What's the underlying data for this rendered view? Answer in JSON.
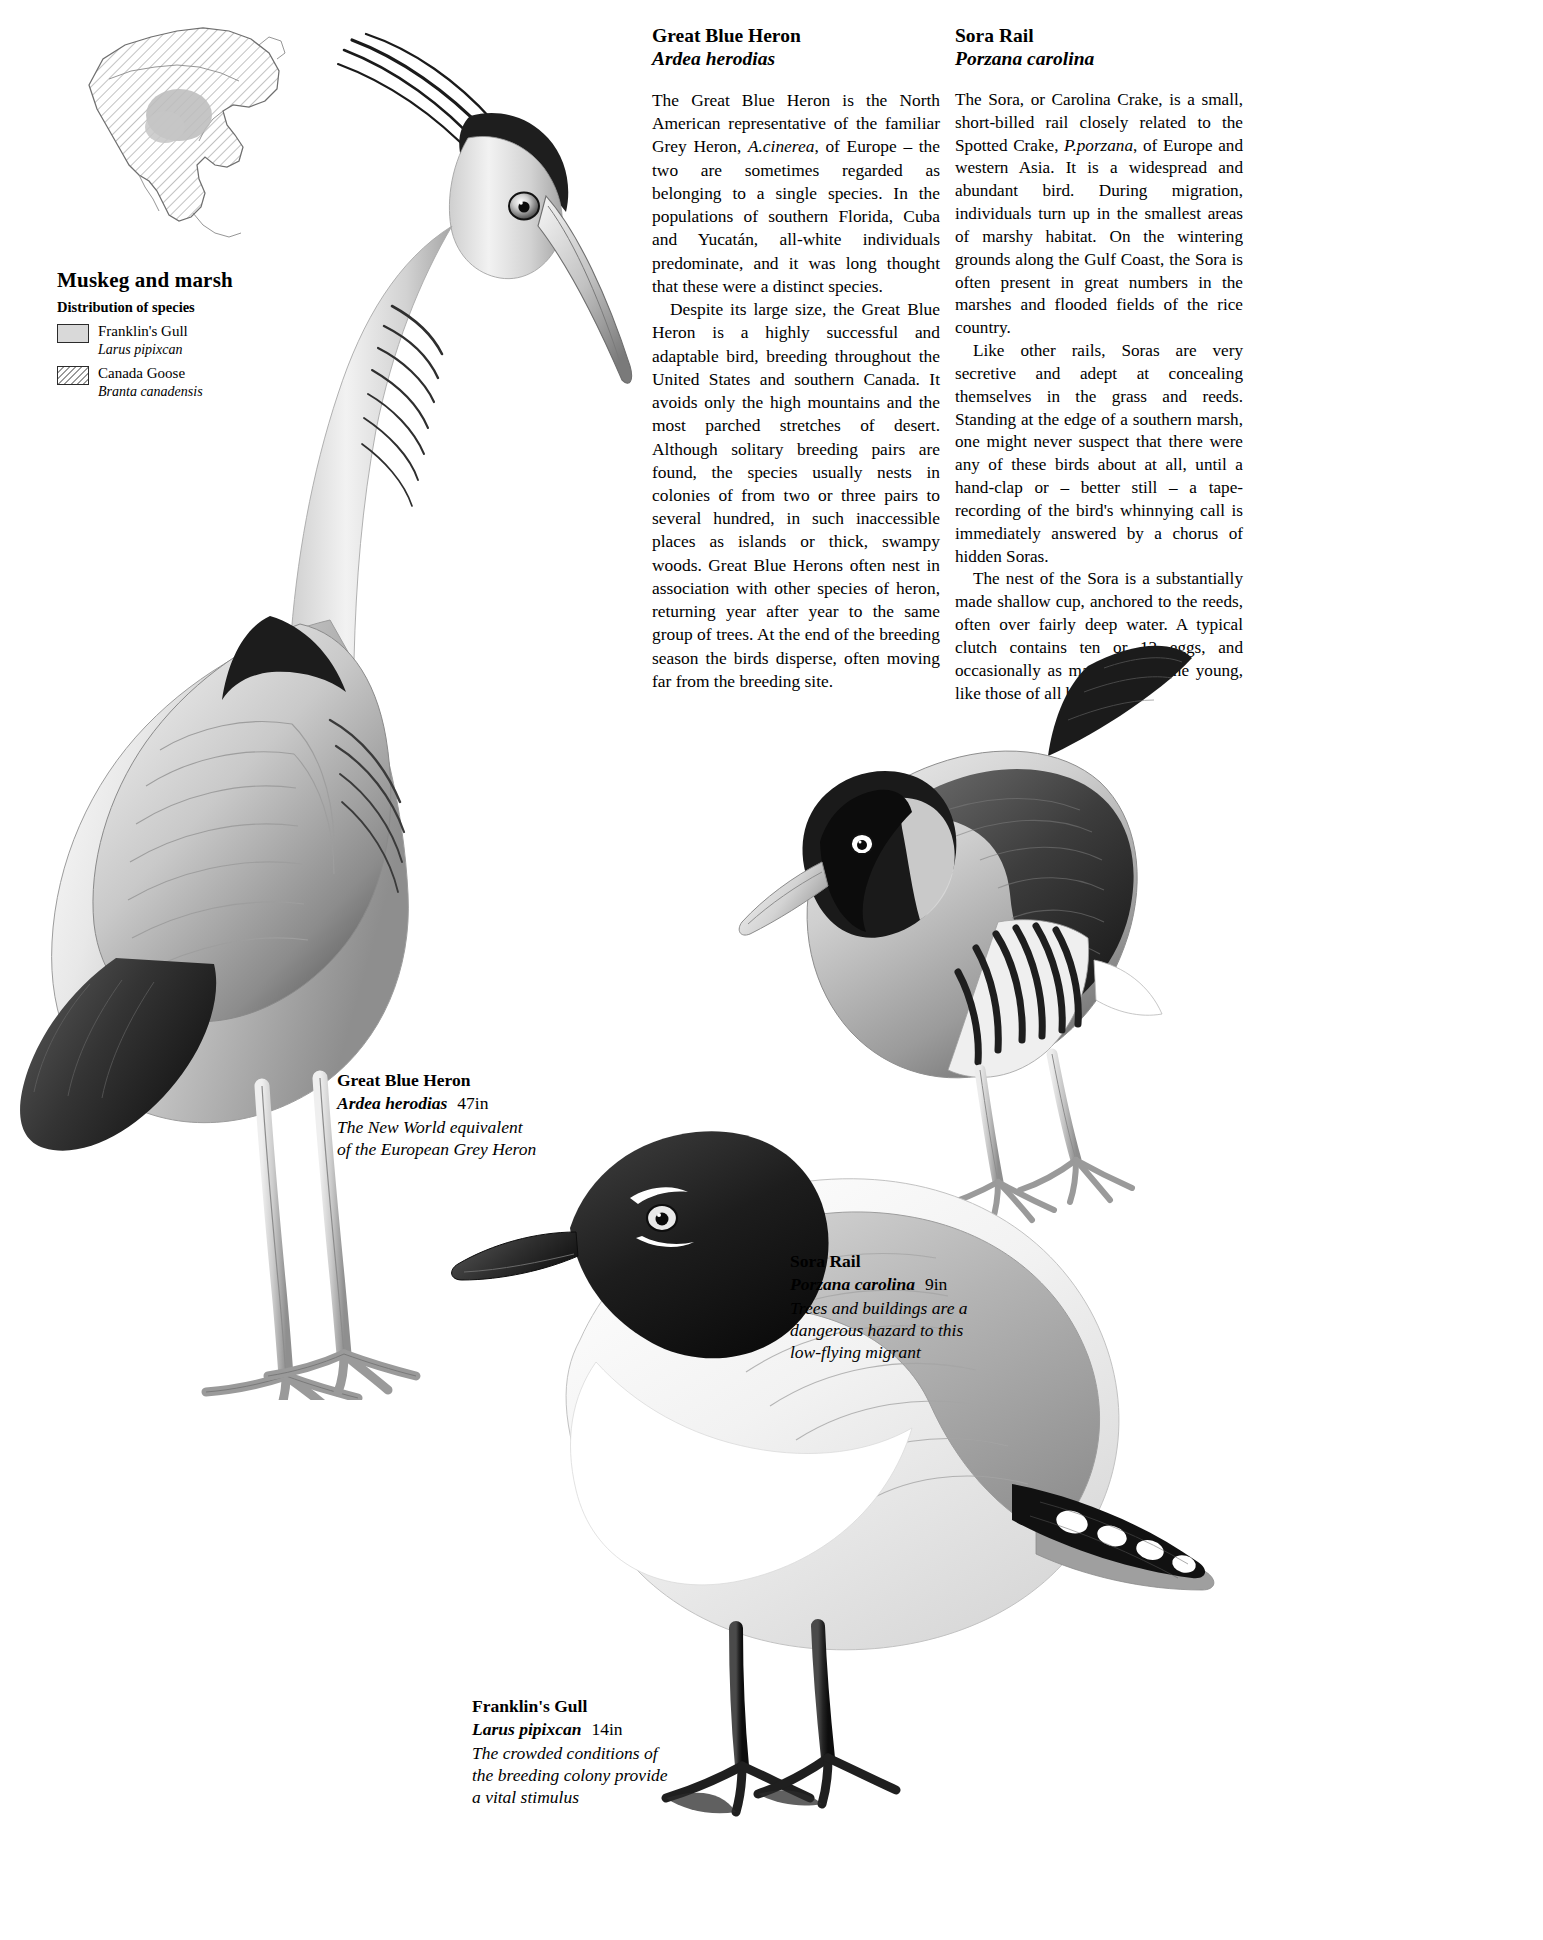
{
  "page": {
    "background_color": "#ffffff",
    "ink_color": "#000000"
  },
  "distribution_panel": {
    "map_name": "north-america-distribution-map",
    "title": "Muskeg and marsh",
    "subtitle": "Distribution of species",
    "legend": [
      {
        "swatch": "solid",
        "swatch_color": "#d9d9d9",
        "common_name": "Franklin's Gull",
        "latin_name": "Larus pipixcan"
      },
      {
        "swatch": "hatch",
        "swatch_color": "#9a9a9a",
        "common_name": "Canada Goose",
        "latin_name": "Branta canadensis"
      }
    ]
  },
  "articles": [
    {
      "id": "great-blue-heron",
      "common_name": "Great Blue Heron",
      "latin_name": "Ardea herodias",
      "paragraphs": [
        "The Great Blue Heron is the North American representative of the familiar Grey Heron, <em>A.cinerea</em>, of Europe – the two are sometimes regarded as belonging to a single species. In the populations of southern Florida, Cuba and Yucatán, all-white individuals predominate, and it was long thought that these were a distinct species.",
        "Despite its large size, the Great Blue Heron is a highly successful and adaptable bird, breeding throughout the United States and southern Canada. It avoids only the high mountains and the most parched stretches of desert. Although solitary breeding pairs are found, the species usually nests in colonies of from two or three pairs to several hundred, in such inaccessible places as islands or thick, swampy woods. Great Blue Herons often nest in association with other species of heron, returning year after year to the same group of trees. At the end of the breeding season the birds disperse, often moving far from the breeding site."
      ]
    },
    {
      "id": "sora-rail",
      "common_name": "Sora Rail",
      "latin_name": "Porzana carolina",
      "paragraphs": [
        "The Sora, or Carolina Crake, is a small, short-billed rail closely related to the Spotted Crake, <em>P.porzana</em>, of Europe and western Asia. It is a widespread and abundant bird. During migration, individuals turn up in the smallest areas of marshy habitat. On the wintering grounds along the Gulf Coast, the Sora is often present in great numbers in the marshes and flooded fields of the rice country.",
        "Like other rails, Soras are very secretive and adept at concealing themselves in the grass and reeds. Standing at the edge of a southern marsh, one might never suspect that there were any of these birds about at all, until a hand-clap or – better still – a tape-recording of the bird's whinnying call is immediately answered by a chorus of hidden Soras.",
        "The nest of the Sora is a substantially made shallow cup, anchored to the reeds, often over fairly deep water. A typical clutch contains ten or 12 eggs, and occasionally as many as 18. The young, like those of all but the"
      ]
    }
  ],
  "plate_captions": [
    {
      "id": "great-blue-heron-caption",
      "common_name": "Great Blue Heron",
      "latin_name": "Ardea herodias",
      "size": "47in",
      "note_line_1": "The New World equivalent",
      "note_line_2": "of the European Grey Heron"
    },
    {
      "id": "sora-rail-caption",
      "common_name": "Sora Rail",
      "latin_name": "Porzana carolina",
      "size": "9in",
      "note_line_1": "Trees and buildings are a",
      "note_line_2": "dangerous hazard to this",
      "note_line_3": "low-flying migrant"
    },
    {
      "id": "franklins-gull-caption",
      "common_name": "Franklin's Gull",
      "latin_name": "Larus pipixcan",
      "size": "14in",
      "note_line_1": "The crowded conditions of",
      "note_line_2": "the breeding colony provide",
      "note_line_3": "a vital stimulus"
    }
  ],
  "illustrations": [
    {
      "name": "great-blue-heron-illustration"
    },
    {
      "name": "sora-rail-illustration"
    },
    {
      "name": "franklins-gull-illustration"
    }
  ]
}
